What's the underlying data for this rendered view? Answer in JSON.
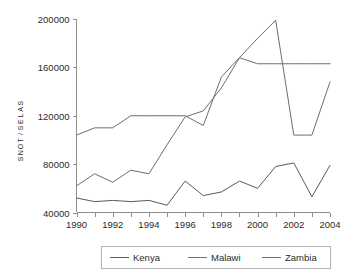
{
  "chart_data": {
    "type": "line",
    "title": "",
    "xlabel": "",
    "ylabel": "SALES/TONS",
    "x": [
      1990,
      1991,
      1992,
      1993,
      1994,
      1995,
      1996,
      1997,
      1998,
      1999,
      2000,
      2001,
      2002,
      2003,
      2004
    ],
    "xlim": [
      1990,
      2004
    ],
    "ylim": [
      40000,
      200000
    ],
    "grid": false,
    "legend_position": "bottom",
    "xtick_labels": [
      "1990",
      "1992",
      "1994",
      "1996",
      "1998",
      "2000",
      "2002",
      "2004"
    ],
    "xtick_values": [
      1990,
      1992,
      1994,
      1996,
      1998,
      2000,
      2002,
      2004
    ],
    "ytick_labels": [
      "40000",
      "80000",
      "120000",
      "160000",
      "200000"
    ],
    "ytick_values": [
      40000,
      80000,
      120000,
      160000,
      200000
    ],
    "series": [
      {
        "name": "Kenya",
        "color": "#5a5a5a",
        "values": [
          52000,
          49000,
          50000,
          49000,
          50000,
          46000,
          66000,
          54000,
          57000,
          66000,
          60000,
          78000,
          81000,
          53000,
          79000
        ]
      },
      {
        "name": "Malawi",
        "color": "#6e6e6e",
        "values": [
          104000,
          110000,
          110000,
          120000,
          120000,
          120000,
          120000,
          112000,
          152000,
          168000,
          163000,
          163000,
          163000,
          163000,
          163000
        ]
      },
      {
        "name": "Zambia",
        "color": "#6e6e6e",
        "values": [
          62000,
          72000,
          65000,
          75000,
          72000,
          96000,
          119000,
          124000,
          143000,
          168000,
          184000,
          199000,
          104000,
          104000,
          148000
        ]
      }
    ]
  },
  "legend": {
    "entries": [
      "Kenya",
      "Malawi",
      "Zambia"
    ]
  },
  "axis": {
    "y_title": "SALES/TONS"
  }
}
